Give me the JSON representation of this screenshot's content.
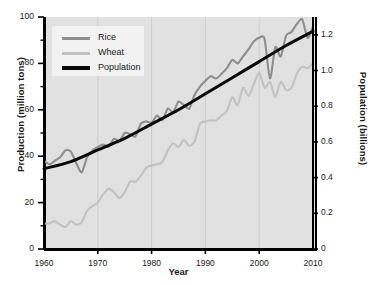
{
  "chart_data": {
    "type": "line",
    "title": "",
    "xlabel": "Year",
    "ylabel": "Production (million tons)",
    "ylabel_right": "Population (billions)",
    "xlim": [
      1960,
      2010
    ],
    "ylim": [
      0,
      100
    ],
    "ylim_right": [
      0,
      1.3
    ],
    "grid": "vertical",
    "legend_position": "top-left",
    "xticks": [
      "1960",
      "1970",
      "1980",
      "1990",
      "2000",
      "2010"
    ],
    "xtick_values": [
      1960,
      1970,
      1980,
      1990,
      2000,
      2010
    ],
    "yticks_left": [
      "0",
      "20",
      "40",
      "60",
      "80",
      "100"
    ],
    "ytick_values_left": [
      0,
      20,
      40,
      60,
      80,
      100
    ],
    "yticks_right": [
      "0",
      "0.2",
      "0.4",
      "0.6",
      "0.8",
      "1.0",
      "1.2"
    ],
    "ytick_values_right": [
      0,
      0.2,
      0.4,
      0.6,
      0.8,
      1.0,
      1.2
    ],
    "series": [
      {
        "name": "Rice",
        "color": "#8e8e8e",
        "axis": "left",
        "x": [
          1960,
          1961,
          1962,
          1963,
          1964,
          1965,
          1966,
          1967,
          1968,
          1969,
          1970,
          1971,
          1972,
          1973,
          1974,
          1975,
          1976,
          1977,
          1978,
          1979,
          1980,
          1981,
          1982,
          1983,
          1984,
          1985,
          1986,
          1987,
          1988,
          1989,
          1990,
          1991,
          1992,
          1993,
          1994,
          1995,
          1996,
          1997,
          1998,
          1999,
          2000,
          2001,
          2002,
          2003,
          2004,
          2005,
          2006,
          2007,
          2008,
          2009,
          2010
        ],
        "values": [
          38,
          36.5,
          38,
          39.5,
          42.5,
          42,
          37,
          33,
          39.5,
          42.5,
          44,
          45,
          44,
          47.5,
          46.5,
          50,
          49.5,
          48.5,
          54,
          55,
          54.5,
          57.5,
          55.5,
          60.5,
          59,
          63.5,
          62,
          60.5,
          66.5,
          70,
          72.5,
          74.5,
          73.5,
          75.5,
          78,
          81.5,
          80,
          83,
          86,
          89.5,
          91,
          90.5,
          73.5,
          87,
          83,
          92,
          93.5,
          97,
          99,
          91,
          96
        ]
      },
      {
        "name": "Wheat",
        "color": "#c2c2c2",
        "axis": "left",
        "x": [
          1960,
          1961,
          1962,
          1963,
          1964,
          1965,
          1966,
          1967,
          1968,
          1969,
          1970,
          1971,
          1972,
          1973,
          1974,
          1975,
          1976,
          1977,
          1978,
          1979,
          1980,
          1981,
          1982,
          1983,
          1984,
          1985,
          1986,
          1987,
          1988,
          1989,
          1990,
          1991,
          1992,
          1993,
          1994,
          1995,
          1996,
          1997,
          1998,
          1999,
          2000,
          2001,
          2002,
          2003,
          2004,
          2005,
          2006,
          2007,
          2008,
          2009,
          2010
        ],
        "values": [
          11,
          11,
          12,
          10.5,
          9.5,
          12,
          10.5,
          11.5,
          16.5,
          18.5,
          20,
          23.5,
          26,
          24.5,
          22,
          24.5,
          29,
          29,
          31.5,
          35,
          36,
          36.5,
          37.5,
          42.5,
          45.5,
          44,
          47,
          44.5,
          46.5,
          54,
          55,
          55.5,
          55.5,
          57.5,
          59.5,
          65.5,
          62,
          69.5,
          66,
          71,
          76,
          69.5,
          72,
          65.5,
          72,
          68.5,
          69.5,
          75.5,
          78.5,
          78,
          80
        ]
      },
      {
        "name": "Population",
        "color": "#0a0a0a",
        "axis": "right",
        "x": [
          1960,
          1965,
          1970,
          1975,
          1980,
          1985,
          1990,
          1995,
          2000,
          2005,
          2010
        ],
        "values": [
          0.45,
          0.49,
          0.555,
          0.62,
          0.7,
          0.78,
          0.87,
          0.96,
          1.05,
          1.14,
          1.22
        ]
      }
    ]
  },
  "legend": {
    "items": [
      {
        "label": "Rice"
      },
      {
        "label": "Wheat"
      },
      {
        "label": "Population"
      }
    ]
  },
  "axes": {
    "x_title": "Year",
    "y_title_left": "Production (million tons)",
    "y_title_right": "Population (billions)"
  },
  "colors": {
    "rice": "#8e8e8e",
    "wheat": "#c2c2c2",
    "population": "#0a0a0a",
    "plot_background": "#e1e1e1",
    "legend_background": "#f2f2f2",
    "axis": "#000000",
    "gridline": "#cdcdcd"
  }
}
